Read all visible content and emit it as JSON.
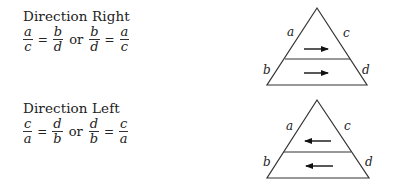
{
  "sections": [
    {
      "heading": "Direction Right",
      "equation": {
        "left": {
          "lhs": {
            "num": "a",
            "den": "c"
          },
          "rhs": {
            "num": "b",
            "den": "d"
          }
        },
        "connector": "or",
        "right": {
          "lhs": {
            "num": "b",
            "den": "d"
          },
          "rhs": {
            "num": "a",
            "den": "c"
          }
        },
        "equals": "="
      },
      "diagram": {
        "labels": {
          "a": "a",
          "c": "c",
          "b": "b",
          "d": "d"
        },
        "arrow_direction": "right"
      }
    },
    {
      "heading": "Direction Left",
      "equation": {
        "left": {
          "lhs": {
            "num": "c",
            "den": "a"
          },
          "rhs": {
            "num": "d",
            "den": "b"
          }
        },
        "connector": "or",
        "right": {
          "lhs": {
            "num": "d",
            "den": "b"
          },
          "rhs": {
            "num": "c",
            "den": "a"
          }
        },
        "equals": "="
      },
      "diagram": {
        "labels": {
          "a": "a",
          "c": "c",
          "b": "b",
          "d": "d"
        },
        "arrow_direction": "left"
      }
    }
  ]
}
